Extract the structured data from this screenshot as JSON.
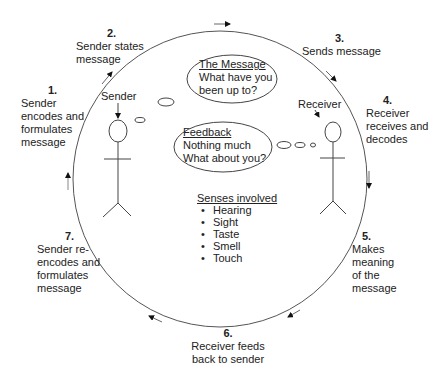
{
  "steps": [
    {
      "num": "1.",
      "text": [
        "Sender",
        "encodes and",
        "formulates",
        "message"
      ]
    },
    {
      "num": "2.",
      "text": [
        "Sender states",
        "message"
      ]
    },
    {
      "num": "3.",
      "text": [
        "Sends message"
      ]
    },
    {
      "num": "4.",
      "text": [
        "Receiver",
        "receives and",
        "decodes"
      ]
    },
    {
      "num": "5.",
      "text": [
        "Makes",
        "meaning",
        "of the",
        "message"
      ]
    },
    {
      "num": "6.",
      "text": [
        "Receiver feeds",
        "back to sender"
      ]
    },
    {
      "num": "7.",
      "text": [
        "Sender re-",
        "encodes and",
        "formulates",
        "message"
      ]
    }
  ],
  "figures": {
    "sender_label": "Sender",
    "receiver_label": "Receiver"
  },
  "message_bubble": {
    "title": "The Message",
    "line1": "What have you",
    "line2": "been up to?"
  },
  "feedback_bubble": {
    "title": "Feedback",
    "line1": "Nothing much",
    "line2": "What about you?"
  },
  "senses": {
    "title": "Senses involved",
    "items": [
      "Hearing",
      "Sight",
      "Taste",
      "Smell",
      "Touch"
    ]
  },
  "colors": {
    "line": "#555555",
    "text": "#222222",
    "background": "#ffffff"
  }
}
